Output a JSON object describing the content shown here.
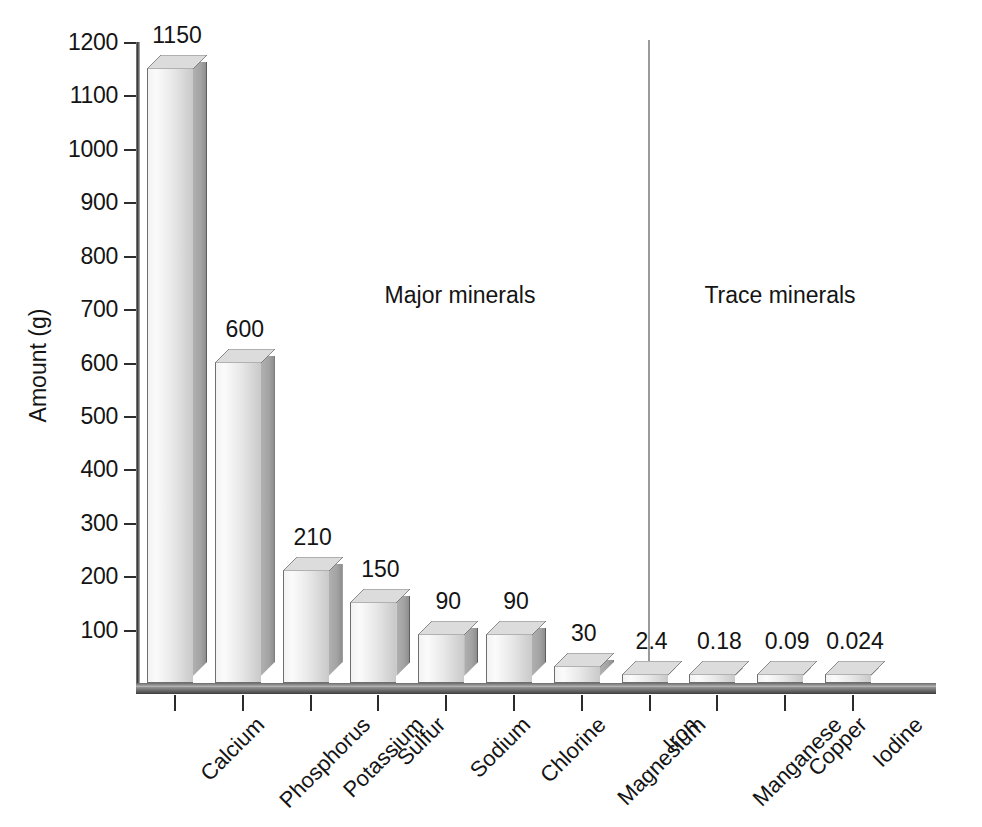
{
  "chart_data": {
    "type": "bar",
    "title": "",
    "xlabel": "",
    "ylabel": "Amount (g)",
    "ylim": [
      0,
      1200
    ],
    "ytick_step": 100,
    "grid": false,
    "legend": "none",
    "style": "3d-bar",
    "categories": [
      "Calcium",
      "Phosphorus",
      "Potassium",
      "Sulfur",
      "Sodium",
      "Chlorine",
      "Magnesium",
      "Iron",
      "Manganese",
      "Copper",
      "Iodine"
    ],
    "values": [
      1150,
      600,
      210,
      150,
      90,
      90,
      30,
      2.4,
      0.18,
      0.09,
      0.024
    ],
    "value_labels": [
      "1150",
      "600",
      "210",
      "150",
      "90",
      "90",
      "30",
      "2.4",
      "0.18",
      "0.09",
      "0.024"
    ],
    "ytick_labels": [
      "1200",
      "1100",
      "1000",
      "900",
      "800",
      "700",
      "600",
      "500",
      "400",
      "300",
      "200",
      "100"
    ],
    "yticks": [
      1200,
      1100,
      1000,
      900,
      800,
      700,
      600,
      500,
      400,
      300,
      200,
      100
    ],
    "annotations": [
      {
        "text": "Major minerals",
        "group": "major"
      },
      {
        "text": "Trace minerals",
        "group": "trace"
      }
    ],
    "groups": {
      "major": [
        "Calcium",
        "Phosphorus",
        "Potassium",
        "Sulfur",
        "Sodium",
        "Chlorine",
        "Magnesium"
      ],
      "trace": [
        "Iron",
        "Manganese",
        "Copper",
        "Iodine"
      ]
    },
    "colors": {
      "bar_front_light": "#f2f2f2",
      "bar_front_dark": "#c9c9c9",
      "bar_side": "#a3a3a3",
      "bar_top": "#dcdcdc",
      "axis": "#2e2e2e",
      "divider": "#9a9a9a",
      "text": "#141414",
      "background": "#ffffff"
    }
  },
  "axis": {
    "y_title": "Amount (g)"
  }
}
